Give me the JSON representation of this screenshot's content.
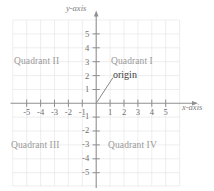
{
  "figure": {
    "type": "coordinate-plane",
    "axes": {
      "x_axis_label": "x-axis",
      "y_axis_label": "y-axis",
      "x_ticks": [
        "-5",
        "-4",
        "-3",
        "-2",
        "-1",
        "1",
        "2",
        "3",
        "4",
        "5"
      ],
      "y_ticks": [
        "5",
        "4",
        "3",
        "2",
        "1",
        "-1",
        "-2",
        "-3",
        "-4",
        "-5"
      ],
      "xlim": [
        -6,
        6
      ],
      "ylim": [
        -6,
        6
      ],
      "grid": true,
      "arrows": [
        "x-positive",
        "y-positive"
      ]
    },
    "annotations": {
      "origin_label": "origin",
      "origin_point": [
        0,
        0
      ]
    },
    "quadrants": [
      {
        "name": "quadrant-1",
        "label": "Quadrant I",
        "x": 3,
        "y": 3
      },
      {
        "name": "quadrant-2",
        "label": "Quadrant II",
        "x": -3,
        "y": 3
      },
      {
        "name": "quadrant-3",
        "label": "Quadrant III",
        "x": -3,
        "y": -3.5
      },
      {
        "name": "quadrant-4",
        "label": "Quadrant IV",
        "x": 3,
        "y": -3.5
      }
    ],
    "colors": {
      "grid": "#e4e4e4",
      "axis": "#9a9a9a",
      "tick_text": "#6e6e6e",
      "quadrant_text": "#9a9a9a",
      "annotation_text": "#3d3d3d",
      "background": "#ffffff"
    }
  }
}
